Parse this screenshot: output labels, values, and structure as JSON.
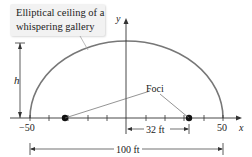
{
  "callout": {
    "line1": "Elliptical ceiling of a",
    "line2": "whispering gallery"
  },
  "axes": {
    "x_label": "x",
    "y_label": "y"
  },
  "ticks": {
    "left": "−50",
    "right": "50"
  },
  "labels": {
    "height": "h",
    "foci": "Foci",
    "focus_distance": "32 ft",
    "width": "100 ft"
  },
  "colors": {
    "ellipse": "#777777",
    "axis": "#333333",
    "focus": "#111111"
  }
}
